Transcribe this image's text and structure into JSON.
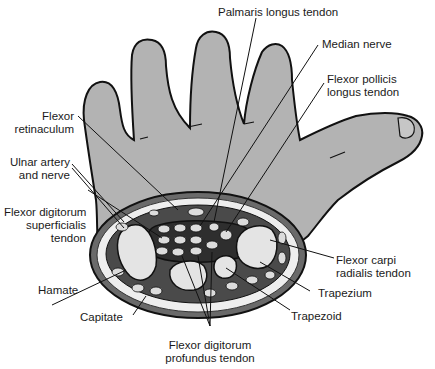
{
  "figure": {
    "colors": {
      "skin": "#b3b3b3",
      "outline": "#111111",
      "tunnel_dark": "#3a3a3a",
      "bone": "#e4e4e4",
      "fat": "#f0f0f0",
      "muscle": "#8a8a8a",
      "background": "#ffffff"
    }
  },
  "labels": {
    "palmaris_longus": {
      "line1": "Palmaris longus tendon"
    },
    "median_nerve": {
      "line1": "Median nerve"
    },
    "flexor_pollicis_longus": {
      "line1": "Flexor pollicis",
      "line2": "longus tendon"
    },
    "flexor_retinaculum": {
      "line1": "Flexor",
      "line2": "retinaculum"
    },
    "ulnar_artery_nerve": {
      "line1": "Ulnar artery",
      "line2": "and nerve"
    },
    "fds": {
      "line1": "Flexor digitorum",
      "line2": "superficialis",
      "line3": "tendon"
    },
    "flexor_carpi_radialis": {
      "line1": "Flexor carpi",
      "line2": "radialis tendon"
    },
    "hamate": {
      "line1": "Hamate"
    },
    "trapezium": {
      "line1": "Trapezium"
    },
    "capitate": {
      "line1": "Capitate"
    },
    "trapezoid": {
      "line1": "Trapezoid"
    },
    "fdp": {
      "line1": "Flexor digitorum",
      "line2": "profundus tendon"
    }
  }
}
